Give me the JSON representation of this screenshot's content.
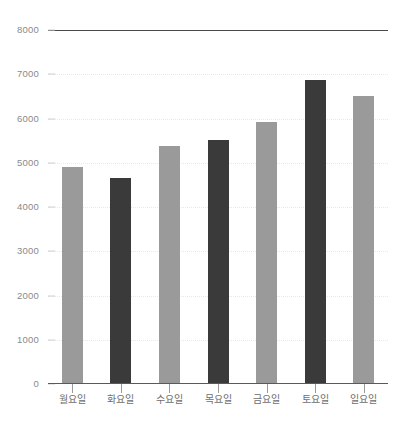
{
  "chart_data": {
    "type": "bar",
    "title": "",
    "subtitle": "",
    "xlabel": "",
    "ylabel": "",
    "categories": [
      "월요일",
      "화요일",
      "수요일",
      "목요일",
      "금요일",
      "토요일",
      "일요일"
    ],
    "values": [
      4900,
      4650,
      5370,
      5520,
      5920,
      6880,
      6500
    ],
    "series": [
      {
        "name": "",
        "values": [
          4900,
          4650,
          5370,
          5520,
          5920,
          6880,
          6500
        ]
      }
    ],
    "bar_colors": [
      "#9a9a9a",
      "#3a3a3a",
      "#9a9a9a",
      "#3a3a3a",
      "#9a9a9a",
      "#3a3a3a",
      "#9a9a9a"
    ],
    "ylim": [
      0,
      8000
    ],
    "ytick_values": [
      0,
      1000,
      2000,
      3000,
      4000,
      5000,
      6000,
      7000,
      8000
    ],
    "ytick_labels": [
      "0",
      "1000",
      "2000",
      "3000",
      "4000",
      "5000",
      "6000",
      "7000",
      "8000"
    ],
    "grid": true,
    "grid_style": "dotted",
    "legend": false,
    "legend_position": "none",
    "annotations": []
  },
  "colors": {
    "light_bar": "#9a9a9a",
    "dark_bar": "#3a3a3a",
    "gridline": "#e9e9e9",
    "axis_line": "#5a5a5a",
    "top_rule": "#4a4a4a",
    "tick_text": "#8a8a8a",
    "category_text": "#6e6e6e",
    "background": "#ffffff"
  }
}
